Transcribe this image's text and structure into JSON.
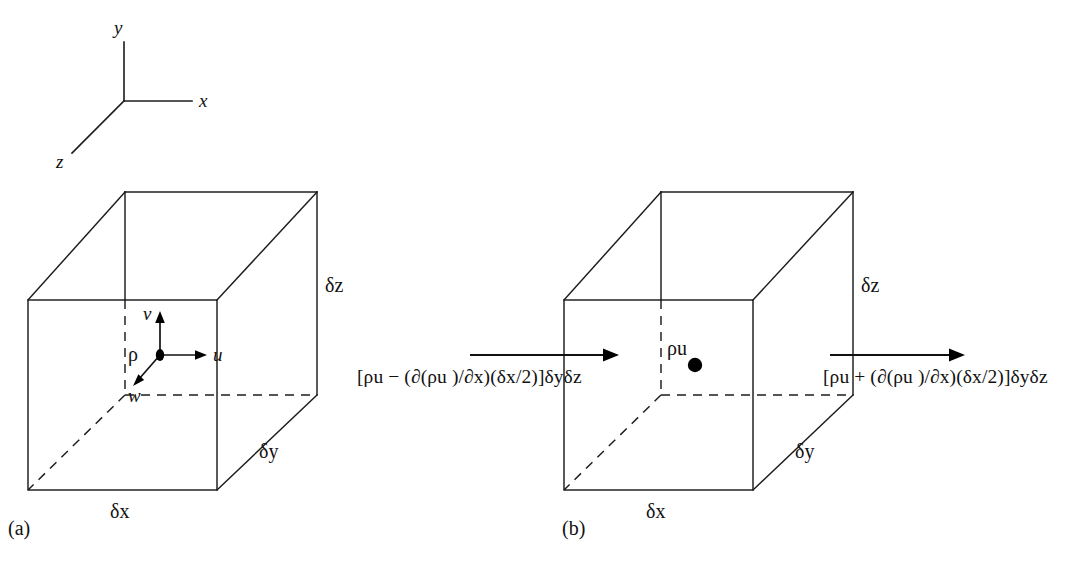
{
  "figure": {
    "type": "technical-diagram",
    "background_color": "#ffffff",
    "line_color": "#1c1c1c"
  },
  "axes_triad": {
    "name": "coordinate-axes",
    "y_label": "y",
    "x_label": "x",
    "z_label": "z"
  },
  "panel_a": {
    "caption": "(a)",
    "cube_labels": {
      "depth_z": "δz",
      "depth_y": "δy",
      "width_x": "δx"
    },
    "point_label": "ρ",
    "velocity_vectors": [
      {
        "name": "v",
        "label": "v",
        "direction": "up"
      },
      {
        "name": "u",
        "label": "u",
        "direction": "right"
      },
      {
        "name": "w",
        "label": "w",
        "direction": "down-left"
      }
    ]
  },
  "panel_b": {
    "caption": "(b)",
    "cube_labels": {
      "depth_z": "δz",
      "depth_y": "δy",
      "width_x": "δx"
    },
    "center_label": "ρu",
    "inflow_expression": "[ρu − (∂(ρu )/∂x)(δx/2)]δyδz",
    "outflow_expression": "[ρu + (∂(ρu )/∂x)(δx/2)]δyδz"
  }
}
